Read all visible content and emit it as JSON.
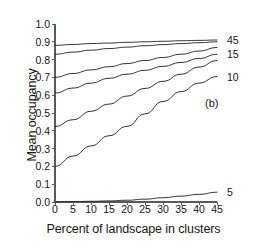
{
  "figure": {
    "panel_annotation": "(b)",
    "background_color": "#ffffff",
    "line_color": "#2b2b2b"
  },
  "axes": {
    "ylabel": "Mean occupancy",
    "xlabel": "Percent of landscape in clusters",
    "yticks": [
      "0.0",
      "0.1",
      "0.2",
      "0.3",
      "0.4",
      "0.5",
      "0.6",
      "0.7",
      "0.8",
      "0.9",
      "1.0"
    ],
    "xticks": [
      "0",
      "5",
      "10",
      "15",
      "20",
      "25",
      "30",
      "35",
      "40",
      "45"
    ]
  },
  "series_labels": [
    {
      "label": "45"
    },
    {
      "label": "15"
    },
    {
      "label": "10"
    },
    {
      "label": "5"
    }
  ],
  "chart_data": {
    "type": "line",
    "title": "",
    "xlabel": "Percent of landscape in clusters",
    "ylabel": "Mean occupancy",
    "xlim": [
      0,
      45
    ],
    "ylim": [
      0.0,
      1.0
    ],
    "xticks": [
      0,
      5,
      10,
      15,
      20,
      25,
      30,
      35,
      40,
      45
    ],
    "yticks": [
      0.0,
      0.1,
      0.2,
      0.3,
      0.4,
      0.5,
      0.6,
      0.7,
      0.8,
      0.9,
      1.0
    ],
    "grid": false,
    "legend": "right-edge-labels",
    "annotations": [
      {
        "text": "(b)",
        "x": 33,
        "y": 0.52
      }
    ],
    "x": [
      0,
      5,
      10,
      15,
      20,
      25,
      30,
      35,
      40,
      45
    ],
    "series": [
      {
        "name": "45",
        "edge_label": "45",
        "values": [
          0.88,
          0.885,
          0.89,
          0.893,
          0.897,
          0.9,
          0.903,
          0.906,
          0.908,
          0.91
        ]
      },
      {
        "name": "30",
        "edge_label": "",
        "values": [
          0.83,
          0.842,
          0.853,
          0.862,
          0.87,
          0.878,
          0.884,
          0.89,
          0.895,
          0.9
        ]
      },
      {
        "name": "20",
        "edge_label": "",
        "values": [
          0.7,
          0.722,
          0.742,
          0.76,
          0.778,
          0.795,
          0.812,
          0.83,
          0.848,
          0.868
        ]
      },
      {
        "name": "15",
        "edge_label": "15",
        "values": [
          0.612,
          0.64,
          0.668,
          0.695,
          0.718,
          0.74,
          0.762,
          0.784,
          0.806,
          0.83
        ]
      },
      {
        "name": "12",
        "edge_label": "",
        "values": [
          0.424,
          0.462,
          0.51,
          0.55,
          0.595,
          0.638,
          0.678,
          0.718,
          0.758,
          0.795
        ]
      },
      {
        "name": "10",
        "edge_label": "10",
        "values": [
          0.2,
          0.258,
          0.315,
          0.372,
          0.425,
          0.495,
          0.565,
          0.62,
          0.668,
          0.705
        ]
      },
      {
        "name": "5",
        "edge_label": "5",
        "values": [
          0.001,
          0.002,
          0.004,
          0.006,
          0.01,
          0.016,
          0.024,
          0.033,
          0.043,
          0.055
        ]
      }
    ]
  },
  "geometry": {
    "plot_left": 55,
    "plot_right": 217,
    "plot_top": 24,
    "plot_bottom": 202
  }
}
